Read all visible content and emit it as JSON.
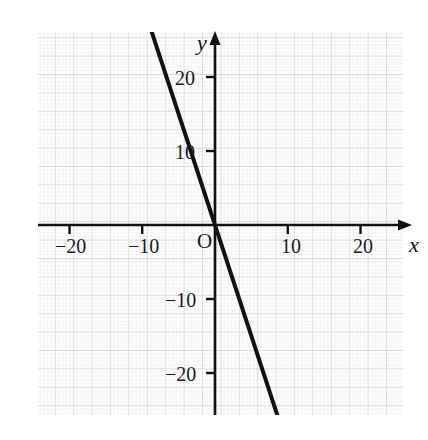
{
  "figure": {
    "background_color": "#ffffff",
    "grid_minor_color": "#e3e3e8",
    "grid_major_color": "#cfcfd6",
    "axis_color": "#111111",
    "line_color": "#111111"
  },
  "axis_names": {
    "x": "x",
    "y": "y"
  },
  "origin_label": "O",
  "chart_data": {
    "type": "line",
    "title": "",
    "subtitle": "",
    "xlabel": "x",
    "ylabel": "y",
    "xlim": [
      -25.0,
      27.5
    ],
    "ylim": [
      -27.0,
      26.5
    ],
    "grid": true,
    "grid_minor_step": 0.5,
    "grid_major_step": 2.5,
    "legend": false,
    "legend_position": "none",
    "xticks": [
      -20,
      -10,
      10,
      20
    ],
    "xtick_labels": [
      "−20",
      "−10",
      "10",
      "20"
    ],
    "yticks": [
      -20,
      -10,
      10,
      20
    ],
    "ytick_labels": [
      "−20",
      "−10",
      "10",
      "20"
    ],
    "origin_marker": "O",
    "series": [
      {
        "name": "y = -3x",
        "equation": "y = -3x",
        "slope": -3,
        "intercept": 0,
        "x": [
          -17.1,
          9.3
        ],
        "values": [
          51.3,
          -27.9
        ],
        "endpoints": [
          {
            "x": -17.1,
            "y": 51.3
          },
          {
            "x": 9.3,
            "y": -27.9
          }
        ],
        "points_on_line": [
          {
            "x": -10,
            "y": 30
          },
          {
            "x": -5,
            "y": 15
          },
          {
            "x": 0,
            "y": 0
          },
          {
            "x": 5,
            "y": -15
          },
          {
            "x": 9,
            "y": -27
          }
        ],
        "color": "#111111",
        "width": 4
      }
    ]
  }
}
